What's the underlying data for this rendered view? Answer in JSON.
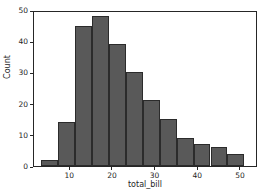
{
  "chart_data": {
    "type": "bar",
    "subtype": "histogram",
    "title": "",
    "xlabel": "total_bill",
    "ylabel": "Count",
    "xlim": [
      1.5,
      54.0
    ],
    "ylim": [
      0,
      50
    ],
    "grid": false,
    "legend": null,
    "bin_edges": [
      3.07,
      7.05,
      11.03,
      15.01,
      18.99,
      22.97,
      26.95,
      30.93,
      34.91,
      38.89,
      42.87,
      46.85,
      50.83
    ],
    "categories": [
      "3.07-7.05",
      "7.05-11.03",
      "11.03-15.01",
      "15.01-18.99",
      "18.99-22.97",
      "22.97-26.95",
      "26.95-30.93",
      "30.93-34.91",
      "34.91-38.89",
      "38.89-42.87",
      "42.87-46.85",
      "46.85-50.83"
    ],
    "values": [
      2,
      14,
      45,
      48,
      39,
      30,
      21,
      15,
      9,
      7,
      6,
      4
    ],
    "bars": [
      {
        "x0": 3.07,
        "x1": 7.05,
        "count": 2
      },
      {
        "x0": 7.05,
        "x1": 11.03,
        "count": 14
      },
      {
        "x0": 11.03,
        "x1": 15.01,
        "count": 45
      },
      {
        "x0": 15.01,
        "x1": 18.99,
        "count": 48
      },
      {
        "x0": 18.99,
        "x1": 22.97,
        "count": 39
      },
      {
        "x0": 22.97,
        "x1": 26.95,
        "count": 30
      },
      {
        "x0": 26.95,
        "x1": 30.93,
        "count": 21
      },
      {
        "x0": 30.93,
        "x1": 34.91,
        "count": 15
      },
      {
        "x0": 34.91,
        "x1": 38.89,
        "count": 9
      },
      {
        "x0": 38.89,
        "x1": 42.87,
        "count": 7
      },
      {
        "x0": 42.87,
        "x1": 46.85,
        "count": 6
      },
      {
        "x0": 46.85,
        "x1": 50.83,
        "count": 4
      }
    ],
    "x_ticks": [
      10,
      20,
      30,
      40,
      50
    ],
    "x_tick_labels": [
      "10",
      "20",
      "30",
      "40",
      "50"
    ],
    "y_ticks": [
      0,
      10,
      20,
      30,
      40,
      50
    ],
    "y_tick_labels": [
      "0",
      "10",
      "20",
      "30",
      "40",
      "50"
    ],
    "colors": {
      "bar_fill": "#595959",
      "bar_edge": "#2b2b2b",
      "axis": "#262626",
      "background": "#ffffff"
    }
  }
}
